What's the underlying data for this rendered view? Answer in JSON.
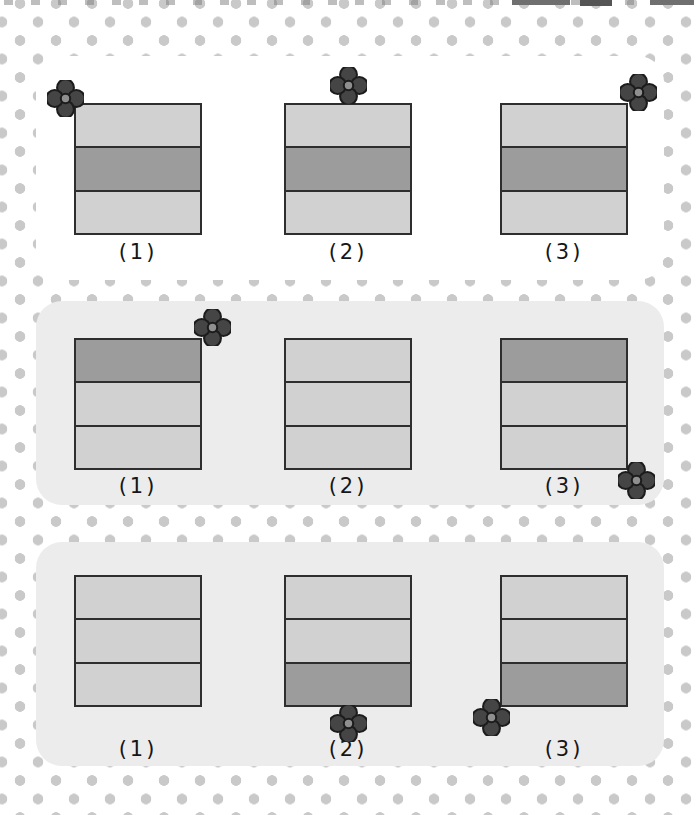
{
  "groups": [
    {
      "id": 1,
      "items": [
        {
          "label": "(1)",
          "bands": [
            "light",
            "dark",
            "light"
          ],
          "flower": "top-left"
        },
        {
          "label": "(2)",
          "bands": [
            "light",
            "dark",
            "light"
          ],
          "flower": "top-center"
        },
        {
          "label": "(3)",
          "bands": [
            "light",
            "dark",
            "light"
          ],
          "flower": "top-right"
        }
      ]
    },
    {
      "id": 2,
      "items": [
        {
          "label": "(1)",
          "bands": [
            "dark",
            "light",
            "light"
          ],
          "flower": "top-right"
        },
        {
          "label": "(2)",
          "bands": [
            "light",
            "light",
            "light"
          ]
        },
        {
          "label": "(3)",
          "bands": [
            "dark",
            "light",
            "light"
          ],
          "flower": "bottom-right"
        }
      ]
    },
    {
      "id": 3,
      "items": [
        {
          "label": "(1)",
          "bands": [
            "light",
            "light",
            "light"
          ]
        },
        {
          "label": "(2)",
          "bands": [
            "light",
            "light",
            "dark"
          ],
          "flower": "bottom-center"
        },
        {
          "label": "(3)",
          "bands": [
            "light",
            "light",
            "dark"
          ],
          "flower": "bottom-left"
        }
      ]
    }
  ],
  "icons": {
    "flower": "four-petal-flower-marker",
    "top_edge": "cropped-text-fragments"
  },
  "colors": {
    "dot": "#c9c9c9",
    "panel_gray": "#ececec",
    "band_light": "#d1d1d1",
    "band_dark": "#9c9c9c",
    "band_border": "#2e2e2e",
    "flower_petal": "#454545",
    "flower_center": "#8f8f8f",
    "flower_outline": "#1c1c1c",
    "label_ink": "#161616"
  }
}
